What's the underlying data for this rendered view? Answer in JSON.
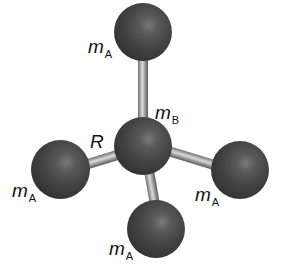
{
  "diagram": {
    "type": "molecular-ball-and-stick",
    "colors": {
      "background": "#ffffff",
      "atom": "#3a3a3a",
      "atom_highlight": "#7a7a7a",
      "bond": "#bdbdbd",
      "text": "#111111"
    },
    "atoms": [
      {
        "id": "center",
        "label_main": "m",
        "label_sub": "B"
      },
      {
        "id": "top",
        "label_main": "m",
        "label_sub": "A"
      },
      {
        "id": "left",
        "label_main": "m",
        "label_sub": "A"
      },
      {
        "id": "right",
        "label_main": "m",
        "label_sub": "A"
      },
      {
        "id": "bottom",
        "label_main": "m",
        "label_sub": "A"
      }
    ],
    "bond_label": "R"
  }
}
